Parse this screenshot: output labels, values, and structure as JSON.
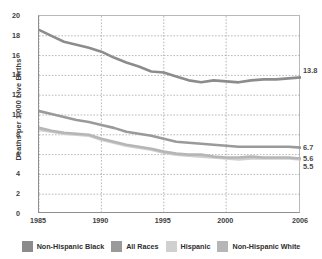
{
  "chart_data": {
    "type": "line",
    "title": "",
    "xlabel": "",
    "ylabel": "Deaths per 1,000 Live Births",
    "xlim": [
      1985,
      2006
    ],
    "ylim": [
      0,
      20
    ],
    "ytick_step": 2,
    "grid": true,
    "legend_position": "bottom",
    "x": [
      1985,
      1986,
      1987,
      1988,
      1989,
      1990,
      1991,
      1992,
      1993,
      1994,
      1995,
      1996,
      1997,
      1998,
      1999,
      2000,
      2001,
      2002,
      2003,
      2004,
      2005,
      2006
    ],
    "xticks": [
      "1985",
      "1990",
      "1995",
      "2000",
      "2006"
    ],
    "yticks": [
      "0",
      "2",
      "4",
      "6",
      "8",
      "10",
      "12",
      "14",
      "16",
      "18",
      "20"
    ],
    "series": [
      {
        "name": "Non-Hispanic Black",
        "color": "#8c8c8c",
        "end_label": "13.8",
        "values": [
          18.6,
          18.0,
          17.4,
          17.1,
          16.8,
          16.4,
          15.8,
          15.3,
          14.9,
          14.4,
          14.3,
          13.9,
          13.5,
          13.3,
          13.5,
          13.4,
          13.3,
          13.5,
          13.6,
          13.6,
          13.7,
          13.8
        ]
      },
      {
        "name": "All Races",
        "color": "#9a9a9a",
        "end_label": "6.7",
        "values": [
          10.4,
          10.1,
          9.8,
          9.5,
          9.3,
          9.0,
          8.7,
          8.3,
          8.1,
          7.9,
          7.6,
          7.3,
          7.2,
          7.1,
          7.0,
          6.9,
          6.8,
          6.8,
          6.8,
          6.8,
          6.8,
          6.7
        ]
      },
      {
        "name": "Hispanic",
        "color": "#d0d0d0",
        "end_label": "5.5",
        "values": [
          8.5,
          8.3,
          8.1,
          8.0,
          7.9,
          7.5,
          7.2,
          6.9,
          6.7,
          6.5,
          6.2,
          6.0,
          5.9,
          5.8,
          5.7,
          5.6,
          5.5,
          5.6,
          5.6,
          5.6,
          5.6,
          5.5
        ]
      },
      {
        "name": "Non-Hispanic White",
        "color": "#b6b6b6",
        "end_label": "5.6",
        "values": [
          8.7,
          8.4,
          8.2,
          8.1,
          8.0,
          7.6,
          7.3,
          7.0,
          6.8,
          6.6,
          6.3,
          6.1,
          6.0,
          6.0,
          5.8,
          5.7,
          5.7,
          5.8,
          5.7,
          5.7,
          5.7,
          5.6
        ]
      }
    ]
  },
  "legend": {
    "items": [
      {
        "label": "Non-Hispanic Black",
        "color": "#8c8c8c"
      },
      {
        "label": "All Races",
        "color": "#9a9a9a"
      },
      {
        "label": "Hispanic",
        "color": "#d0d0d0"
      },
      {
        "label": "Non-Hispanic White",
        "color": "#b6b6b6"
      }
    ]
  }
}
